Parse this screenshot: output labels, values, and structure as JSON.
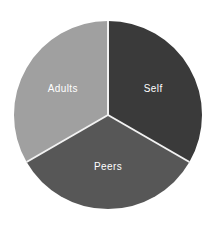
{
  "chart_data": {
    "type": "pie",
    "title": "",
    "subtitle": "",
    "xlabel": "",
    "ylabel": "",
    "legend_position": "none",
    "grid": false,
    "labels_inside_slices": true,
    "total": 100,
    "categories": [
      "Self",
      "Peers",
      "Adults"
    ],
    "values": [
      33.3,
      33.3,
      33.3
    ],
    "slices": [
      {
        "label": "Self",
        "value": 33.3,
        "percent": "33.3%",
        "color": "#3a3a3a",
        "start_angle_deg": 0,
        "end_angle_deg": 120,
        "label_color": "#ffffff"
      },
      {
        "label": "Peers",
        "value": 33.3,
        "percent": "33.3%",
        "color": "#575757",
        "start_angle_deg": 120,
        "end_angle_deg": 240,
        "label_color": "#ffffff"
      },
      {
        "label": "Adults",
        "value": 33.3,
        "percent": "33.3%",
        "color": "#a0a0a0",
        "start_angle_deg": 240,
        "end_angle_deg": 360,
        "label_color": "#ffffff"
      }
    ],
    "geometry": {
      "center_x": 108,
      "center_y": 115,
      "radius": 94,
      "divider_color": "#f2f2f2",
      "divider_width": 2,
      "background": "#ffffff"
    }
  }
}
